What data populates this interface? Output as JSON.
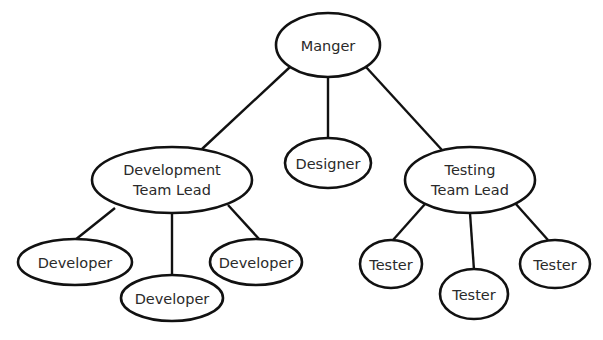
{
  "diagram": {
    "type": "org-chart",
    "colors": {
      "stroke": "#111111",
      "fill": "#ffffff",
      "text": "#2a2a2a"
    },
    "nodes": {
      "manager": {
        "label": "Manger"
      },
      "dev_lead": {
        "line1": "Development",
        "line2": "Team Lead"
      },
      "designer": {
        "label": "Designer"
      },
      "test_lead": {
        "line1": "Testing",
        "line2": "Team Lead"
      },
      "developers": [
        {
          "label": "Developer"
        },
        {
          "label": "Developer"
        },
        {
          "label": "Developer"
        }
      ],
      "testers": [
        {
          "label": "Tester"
        },
        {
          "label": "Tester"
        },
        {
          "label": "Tester"
        }
      ]
    },
    "edges": [
      [
        "Manger",
        "Development Team Lead"
      ],
      [
        "Manger",
        "Designer"
      ],
      [
        "Manger",
        "Testing Team Lead"
      ],
      [
        "Development Team Lead",
        "Developer"
      ],
      [
        "Development Team Lead",
        "Developer"
      ],
      [
        "Development Team Lead",
        "Developer"
      ],
      [
        "Testing Team Lead",
        "Tester"
      ],
      [
        "Testing Team Lead",
        "Tester"
      ],
      [
        "Testing Team Lead",
        "Tester"
      ]
    ]
  }
}
